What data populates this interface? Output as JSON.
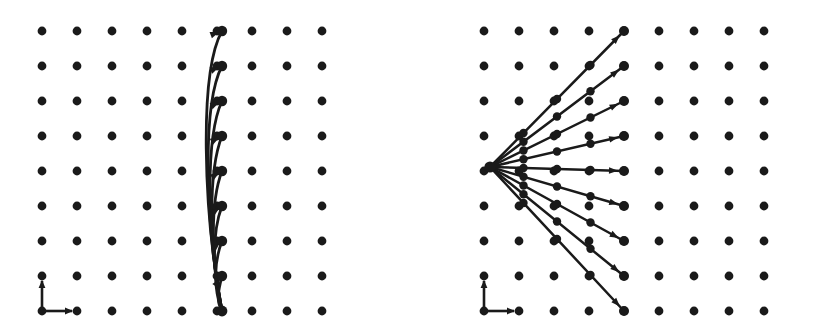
{
  "figure": {
    "background_color": "#ffffff",
    "ink_color": "#1a1a1a",
    "width": 816,
    "height": 330,
    "panel_count": 2
  },
  "chart_data": {
    "type": "scatter",
    "subtitle": "",
    "xlabel": "",
    "ylabel": "",
    "grid": true,
    "legend_position": "none",
    "annotations": [
      "Left panel: curved trajectories bending from a common base point up a single lattice column",
      "Right panel: straight radial rays fanning from a common origin to a single lattice column"
    ],
    "panels": [
      {
        "name": "left-panel",
        "label": "curved-trajectories",
        "origin_x": 0,
        "origin_y": 0,
        "width": 408,
        "height": 330,
        "lattice": {
          "columns": 9,
          "rows": 9,
          "x_start": 42,
          "y_start": 31,
          "x_spacing": 35,
          "y_spacing": 35,
          "dot_radius": 4.4,
          "x_values": [
            42,
            77,
            112,
            147,
            182,
            217,
            252,
            287,
            322
          ],
          "y_values": [
            31,
            66,
            101,
            136,
            171,
            206,
            241,
            276,
            311
          ]
        },
        "source_point": {
          "x": 222,
          "y": 311,
          "label": "base-point"
        },
        "target_column_x": 222,
        "trajectories": [
          {
            "id": 1,
            "end_x": 222,
            "end_y": 31,
            "ctrl1_x": 203,
            "ctrl1_y": 210,
            "ctrl2_x": 199,
            "ctrl2_y": 72,
            "head_angle_deg": 20
          },
          {
            "id": 2,
            "end_x": 222,
            "end_y": 66,
            "ctrl1_x": 205,
            "ctrl1_y": 222,
            "ctrl2_x": 202,
            "ctrl2_y": 104,
            "head_angle_deg": 22
          },
          {
            "id": 3,
            "end_x": 222,
            "end_y": 101,
            "ctrl1_x": 207,
            "ctrl1_y": 236,
            "ctrl2_x": 205,
            "ctrl2_y": 138,
            "head_angle_deg": 25
          },
          {
            "id": 4,
            "end_x": 222,
            "end_y": 136,
            "ctrl1_x": 209,
            "ctrl1_y": 248,
            "ctrl2_x": 208,
            "ctrl2_y": 171,
            "head_angle_deg": 28
          },
          {
            "id": 5,
            "end_x": 222,
            "end_y": 171,
            "ctrl1_x": 211,
            "ctrl1_y": 262,
            "ctrl2_x": 210,
            "ctrl2_y": 202,
            "head_angle_deg": 32
          },
          {
            "id": 6,
            "end_x": 222,
            "end_y": 206,
            "ctrl1_x": 212,
            "ctrl1_y": 275,
            "ctrl2_x": 212,
            "ctrl2_y": 232,
            "head_angle_deg": 36
          },
          {
            "id": 7,
            "end_x": 222,
            "end_y": 241,
            "ctrl1_x": 213,
            "ctrl1_y": 288,
            "ctrl2_x": 214,
            "ctrl2_y": 262,
            "head_angle_deg": 42
          },
          {
            "id": 8,
            "end_x": 222,
            "end_y": 276,
            "ctrl1_x": 216,
            "ctrl1_y": 301,
            "ctrl2_x": 218,
            "ctrl2_y": 292,
            "head_angle_deg": 55
          }
        ],
        "axis_indicator": {
          "base_x": 42,
          "base_y": 311,
          "up_length": 30,
          "right_length": 30,
          "label": "xy-axes-arrows"
        }
      },
      {
        "name": "right-panel",
        "label": "radial-rays",
        "origin_x": 408,
        "origin_y": 0,
        "width": 408,
        "height": 330,
        "lattice": {
          "columns": 9,
          "rows": 9,
          "x_start": 76,
          "y_start": 31,
          "x_spacing": 35,
          "y_spacing": 35,
          "dot_radius": 4.4,
          "x_values": [
            76,
            111,
            146,
            181,
            216,
            251,
            286,
            321,
            356
          ],
          "y_values": [
            31,
            66,
            101,
            136,
            171,
            206,
            241,
            276,
            311
          ]
        },
        "source_point": {
          "x": 82,
          "y": 167,
          "label": "fan-origin"
        },
        "target_column_x": 216,
        "rays": [
          {
            "id": 1,
            "end_x": 216,
            "end_y": 31,
            "angle_deg": -45.4
          },
          {
            "id": 2,
            "end_x": 216,
            "end_y": 66,
            "angle_deg": -36.7
          },
          {
            "id": 3,
            "end_x": 216,
            "end_y": 101,
            "angle_deg": -26.7
          },
          {
            "id": 4,
            "end_x": 216,
            "end_y": 136,
            "angle_deg": -13.8
          },
          {
            "id": 5,
            "end_x": 216,
            "end_y": 171,
            "angle_deg": 1.7
          },
          {
            "id": 6,
            "end_x": 216,
            "end_y": 206,
            "angle_deg": 16.1
          },
          {
            "id": 7,
            "end_x": 216,
            "end_y": 241,
            "angle_deg": 28.4
          },
          {
            "id": 8,
            "end_x": 216,
            "end_y": 276,
            "angle_deg": 38.7
          },
          {
            "id": 9,
            "end_x": 216,
            "end_y": 311,
            "angle_deg": 46.9
          }
        ],
        "axis_indicator": {
          "base_x": 76,
          "base_y": 311,
          "up_length": 30,
          "right_length": 30,
          "label": "xy-axes-arrows"
        }
      }
    ]
  }
}
